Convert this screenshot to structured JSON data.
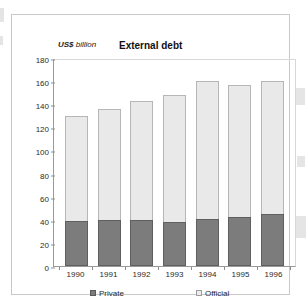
{
  "figure": {
    "unit_label_bold": "US$",
    "unit_label_italic": "billion",
    "title": "External debt"
  },
  "chart_data": {
    "type": "bar",
    "stacked": true,
    "title": "External debt",
    "xlabel": "",
    "ylabel": "US$ billion",
    "ylim": [
      0,
      180
    ],
    "yticks": [
      0,
      20,
      40,
      60,
      80,
      100,
      120,
      140,
      160,
      180
    ],
    "grid": false,
    "legend_position": "bottom",
    "categories": [
      "1990",
      "1991",
      "1992",
      "1993",
      "1994",
      "1995",
      "1996"
    ],
    "series": [
      {
        "name": "Private",
        "color": "#7c7c7c",
        "values": [
          39,
          40,
          40,
          38,
          41,
          42,
          45
        ]
      },
      {
        "name": "Official",
        "color": "#e9e9e9",
        "values": [
          91,
          96,
          103,
          110,
          119,
          115,
          115
        ]
      }
    ],
    "totals": [
      130,
      136,
      143,
      148,
      160,
      157,
      160
    ]
  },
  "legend": {
    "private_label": "Private",
    "official_label": "Official"
  }
}
